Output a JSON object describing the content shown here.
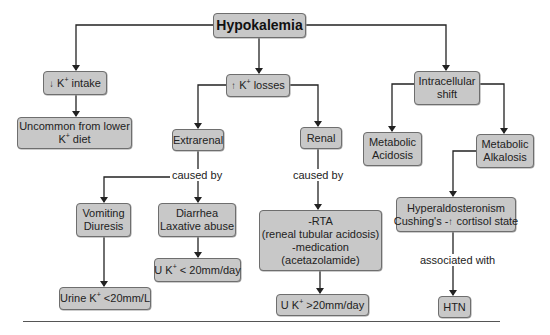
{
  "diagram": {
    "title": "Hypokalemia",
    "nodes": {
      "root": {
        "text": "Hypokalemia"
      },
      "intake": {
        "arrow": "↓",
        "k": "K",
        "sup": "+",
        "text": " intake"
      },
      "uncommon": {
        "line1": "Uncommon from lower",
        "k": "K",
        "sup": "+",
        "line2_text": " diet"
      },
      "losses": {
        "arrow": "↑",
        "k": "K",
        "sup": "+",
        "text": " losses"
      },
      "shift": {
        "line1": "Intracellular",
        "line2": "shift"
      },
      "extrarenal": {
        "text": "Extrarenal"
      },
      "renal": {
        "text": "Renal"
      },
      "acidosis": {
        "line1": "Metabolic",
        "line2": "Acidosis"
      },
      "alkalosis": {
        "line1": "Metabolic",
        "line2": "Alkalosis"
      },
      "vomiting": {
        "line1": "Vomiting",
        "line2": "Diuresis"
      },
      "diarrhea": {
        "line1": "Diarrhea",
        "line2": "Laxative abuse"
      },
      "rta": {
        "line1": "-RTA",
        "line2": "(reneal tubular acidosis)",
        "line3": "-medication",
        "line4": "(acetazolamide)"
      },
      "hyperaldo": {
        "line1": "Hyperaldosteronism",
        "line2_pre": "Cushing's -",
        "arrow": "↑",
        "line2_post": " cortisol state"
      },
      "uk_low_day": {
        "pre": "U K",
        "sup": "+",
        "post": " < 20mm/day"
      },
      "urine_low_l": {
        "pre": "Urine K",
        "sup": "+",
        "post": " <20mm/L"
      },
      "uk_high_day": {
        "pre": "U K",
        "sup": "+",
        "post": " >20mm/day"
      },
      "htn": {
        "text": "HTN"
      }
    },
    "edge_labels": {
      "extrarenal_caused_by": "caused by",
      "renal_caused_by": "caused by",
      "associated_with": "associated with"
    },
    "colors": {
      "node_fill": "#c8c8c8",
      "node_border": "#6e6e6e",
      "connector": "#222222",
      "background": "#ffffff"
    }
  }
}
